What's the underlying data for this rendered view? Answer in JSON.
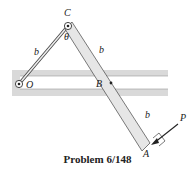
{
  "diagram": {
    "labels": {
      "C": "C",
      "O": "O",
      "B": "B",
      "A": "A",
      "P": "P",
      "theta": "θ",
      "b_OC": "b",
      "b_CB": "b",
      "b_BA": "b"
    },
    "caption": "Problem 6/148",
    "colors": {
      "slot": "#d9d9d9",
      "link_fill": "#e6e6e6",
      "stroke": "#333333"
    }
  }
}
